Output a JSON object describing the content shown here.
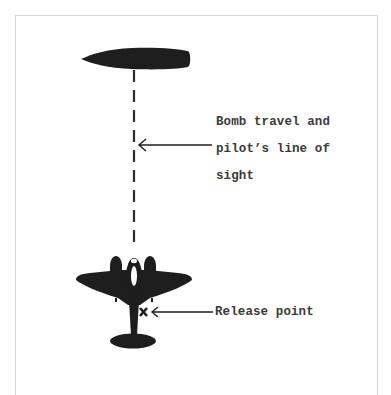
{
  "diagram": {
    "type": "dive-bombing sight line illustration",
    "elements": {
      "target": {
        "name": "target-ship-silhouette",
        "color": "#1e1e1e"
      },
      "line_of_sight": {
        "style": "dashed",
        "color": "#2a2a2a"
      },
      "aircraft": {
        "name": "twin-engine-aircraft-silhouette",
        "color": "#1e1e1e",
        "canopy_color": "#ffffff"
      },
      "release_marker": {
        "glyph": "X",
        "color": "#1e1e1e"
      }
    },
    "annotations": {
      "line_of_sight_label": {
        "lines": [
          "Bomb travel and",
          "pilot’s line of",
          "sight"
        ]
      },
      "release_point_label": {
        "text": "Release point"
      },
      "release_marker_text": "X"
    },
    "colors": {
      "background": "#ffffff",
      "frame": "#d6d6d6",
      "ink": "#1e1e1e",
      "text": "#3a3a3a"
    }
  }
}
